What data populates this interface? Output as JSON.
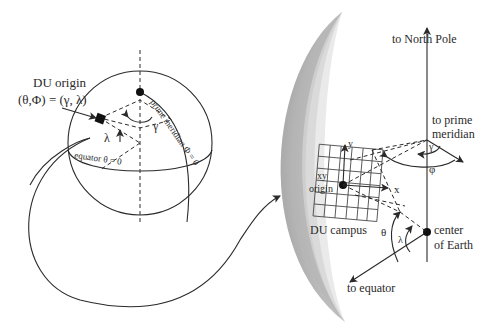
{
  "diagram": {
    "globe": {
      "origin_label_line1": "DU origin",
      "origin_label_line2": "(θ,Φ) = (γ, λ)",
      "prime_meridian_label": "prime meridian Φ = 0",
      "equator_label": "equator θ = 0",
      "gamma": "γ",
      "lambda": "λ"
    },
    "detail": {
      "north_pole_label": "to North Pole",
      "prime_meridian_line1": "to prime",
      "prime_meridian_line2": "meridian",
      "gamma": "γ",
      "phi": "φ",
      "y_axis": "y",
      "x_axis": "x",
      "xy_label": "xy",
      "origin_label": "origin",
      "campus_label": "DU campus",
      "theta": "θ",
      "lambda": "λ",
      "center_line1": "center",
      "center_line2": "of Earth",
      "equator_label": "to equator"
    },
    "colors": {
      "ink": "#2a2a2a",
      "earth_dark": "#8a8a8a",
      "earth_light": "#ffffff"
    }
  }
}
